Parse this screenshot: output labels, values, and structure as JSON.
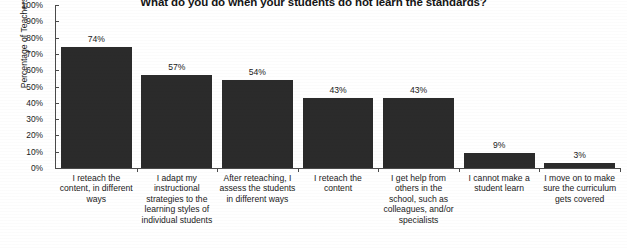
{
  "chart_data": {
    "type": "bar",
    "title": "What do you do when your students do not learn the standards?",
    "xlabel": "",
    "ylabel": "Percentage of Teachers",
    "ylim": [
      0,
      100
    ],
    "grid": false,
    "legend": "none",
    "categories": [
      "I reteach the content, in different ways",
      "I adapt my instructional strategies to the learning styles of individual students",
      "After reteaching, I assess the students in different ways",
      "I reteach the content",
      "I get help from others in the school, such as colleagues, and/or specialists",
      "I cannot make a student learn",
      "I move on to make sure the curriculum gets covered"
    ],
    "values": [
      74,
      57,
      54,
      43,
      43,
      9,
      3
    ],
    "value_labels": [
      "74%",
      "57%",
      "54%",
      "43%",
      "43%",
      "9%",
      "3%"
    ],
    "y_ticks": [
      100,
      90,
      80,
      70,
      60,
      50,
      40,
      30,
      20,
      10,
      0
    ],
    "y_tick_labels": [
      "100%",
      "90%",
      "80%",
      "70%",
      "60%",
      "50%",
      "40%",
      "30%",
      "20%",
      "10%",
      "0%"
    ],
    "bar_color": "#2b2b2b",
    "axis_color": "#4a4a4a",
    "background_color": "#ffffff"
  }
}
